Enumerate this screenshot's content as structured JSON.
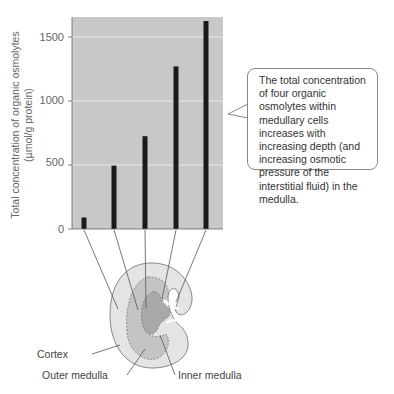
{
  "chart_data": {
    "type": "bar",
    "title": "",
    "xlabel": "",
    "ylabel": "Total concentration of organic osmolytes (µmol/g protein)",
    "ylabel_lines": [
      "Total concentration of organic osmolytes",
      "(µmol/g protein)"
    ],
    "categories": [
      "Position 1 (cortex)",
      "Position 2",
      "Position 3",
      "Position 4",
      "Position 5 (inner medulla tip)"
    ],
    "values": [
      90,
      495,
      725,
      1270,
      1625
    ],
    "ylim": [
      0,
      1700
    ],
    "yticks": [
      0,
      500,
      1000,
      1500
    ],
    "ytick_labels": [
      "0",
      "500",
      "1000",
      "1500"
    ],
    "grid": true,
    "legend": null,
    "background": "#c8c8c8",
    "bar_color": "#1a1a1a",
    "gridline_color": "#e8e8e8"
  },
  "callout": {
    "text": "The total concentration of four organic osmolytes within medullary cells increases with increasing depth (and increasing osmotic pressure of the interstitial fluid) in the medulla."
  },
  "diagram": {
    "labels": {
      "cortex": "Cortex",
      "outer_medulla": "Outer medulla",
      "inner_medulla": "Inner medulla"
    },
    "colors": {
      "cortex": "#e4e4e4",
      "outer_medulla": "#c4c4c4",
      "inner_medulla": "#a9a9a9",
      "outline": "#888888"
    }
  }
}
